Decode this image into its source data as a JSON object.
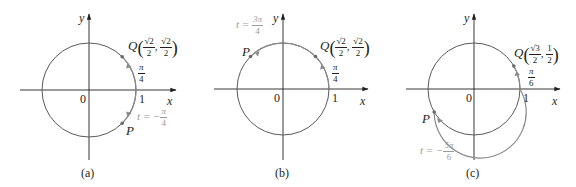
{
  "colors": {
    "axis": "#231f20",
    "circle": "#5a5a5a",
    "arc_highlight": "#8a8a8a",
    "label_gray": "#9a9a9a",
    "text": "#231f20"
  },
  "panels": [
    {
      "id": "a",
      "caption": "(a)",
      "axis_x_label": "x",
      "axis_y_label": "y",
      "origin_label": "0",
      "one_label": "1",
      "Q": {
        "name": "Q",
        "x_num": "√2",
        "x_den": "2",
        "y_num": "√2",
        "y_den": "2"
      },
      "arc_label": {
        "num": "π",
        "den": "4"
      },
      "P": {
        "name": "P"
      },
      "t_label": {
        "prefix": "t = −",
        "num": "π",
        "den": "4"
      }
    },
    {
      "id": "b",
      "caption": "(b)",
      "axis_x_label": "x",
      "axis_y_label": "y",
      "origin_label": "0",
      "one_label": "1",
      "Q": {
        "name": "Q",
        "x_num": "√2",
        "x_den": "2",
        "y_num": "√2",
        "y_den": "2"
      },
      "arc_label": {
        "num": "π",
        "den": "4"
      },
      "P": {
        "name": "P"
      },
      "t_label": {
        "prefix": "t = ",
        "num": "3π",
        "den": "4"
      }
    },
    {
      "id": "c",
      "caption": "(c)",
      "axis_x_label": "x",
      "axis_y_label": "y",
      "origin_label": "0",
      "one_label": "1",
      "Q": {
        "name": "Q",
        "x_num": "√3",
        "x_den": "2",
        "y_num": "1",
        "y_den": "2"
      },
      "arc_label": {
        "num": "π",
        "den": "6"
      },
      "P": {
        "name": "P"
      },
      "t_label": {
        "prefix": "t = −",
        "num": "5π",
        "den": "6"
      }
    }
  ]
}
